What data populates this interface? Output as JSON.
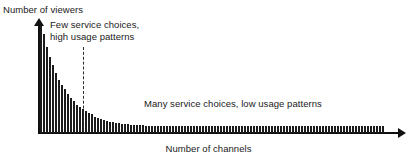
{
  "figure": {
    "background_color": "#ffffff",
    "ink_color": "#1a1a1a",
    "bar_color": "#1c1c1c"
  },
  "labels": {
    "ylabel": "Number of viewers",
    "xlabel": "Number of channels",
    "annotation_left_line1": "Few service choices,",
    "annotation_left_line2": "high usage patterns",
    "annotation_right": "Many service choices, low usage patterns"
  },
  "chart_data": {
    "type": "bar",
    "title": "",
    "subtitle": "",
    "xlabel": "Number of channels",
    "ylabel": "Number of viewers",
    "grid": false,
    "legend": null,
    "axis_style": "arrow-tipped axes, no tick marks, no numeric tick labels",
    "xlim": [
      0,
      115
    ],
    "ylim": [
      0,
      100
    ],
    "x_tick_labels": [],
    "y_tick_labels": [],
    "annotations": [
      {
        "text": "Few service choices, high usage patterns",
        "lines": [
          "Few service choices,",
          "high usage patterns"
        ],
        "region": "head",
        "x_range": [
          0,
          14
        ]
      },
      {
        "text": "Many service choices, low usage patterns",
        "lines": [
          "Many service choices, low usage patterns"
        ],
        "region": "tail",
        "x_range": [
          14,
          115
        ]
      }
    ],
    "divider": {
      "type": "vertical-dashed-line",
      "x_index": 14,
      "label": "head/tail boundary"
    },
    "categories": [
      1,
      2,
      3,
      4,
      5,
      6,
      7,
      8,
      9,
      10,
      11,
      12,
      13,
      14,
      15,
      16,
      17,
      18,
      19,
      20,
      21,
      22,
      23,
      24,
      25,
      26,
      27,
      28,
      29,
      30,
      31,
      32,
      33,
      34,
      35,
      36,
      37,
      38,
      39,
      40,
      41,
      42,
      43,
      44,
      45,
      46,
      47,
      48,
      49,
      50,
      51,
      52,
      53,
      54,
      55,
      56,
      57,
      58,
      59,
      60,
      61,
      62,
      63,
      64,
      65,
      66,
      67,
      68,
      69,
      70,
      71,
      72,
      73,
      74,
      75,
      76,
      77,
      78,
      79,
      80,
      81,
      82,
      83,
      84,
      85,
      86,
      87,
      88,
      89,
      90,
      91,
      92,
      93,
      94,
      95,
      96,
      97,
      98,
      99,
      100,
      101,
      102,
      103,
      104,
      105,
      106,
      107,
      108,
      109,
      110,
      111,
      112,
      113,
      114,
      115
    ],
    "values": [
      98,
      91,
      79,
      70,
      62,
      55,
      49,
      44,
      40,
      36,
      32,
      29,
      26,
      24,
      22,
      20,
      18,
      17,
      15,
      14,
      13,
      12,
      11,
      10,
      10,
      9,
      9,
      8,
      8,
      8,
      7,
      7,
      7,
      7,
      7,
      6,
      6,
      6,
      6,
      6,
      6,
      6,
      6,
      6,
      6,
      6,
      6,
      6,
      6,
      6,
      6,
      6,
      6,
      6,
      6,
      6,
      6,
      6,
      6,
      6,
      6,
      6,
      6,
      6,
      6,
      6,
      6,
      6,
      6,
      6,
      6,
      6,
      6,
      6,
      6,
      6,
      6,
      6,
      6,
      6,
      6,
      6,
      6,
      6,
      6,
      6,
      6,
      6,
      6,
      6,
      6,
      6,
      6,
      6,
      6,
      6,
      6,
      6,
      6,
      6,
      6,
      6,
      6,
      6,
      6,
      6,
      6,
      6,
      6,
      6,
      6,
      6,
      6,
      6,
      6
    ]
  }
}
